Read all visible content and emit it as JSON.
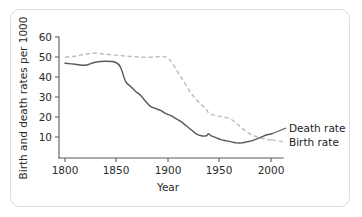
{
  "chart_data": {
    "type": "line",
    "title": "",
    "xlabel": "Year",
    "ylabel": "Birth and death rates per 1000",
    "xlim": [
      1800,
      2010
    ],
    "ylim": [
      0,
      60
    ],
    "xticks": [
      1800,
      1850,
      1900,
      1950,
      2000
    ],
    "yticks": [
      10,
      20,
      30,
      40,
      50,
      60
    ],
    "grid": false,
    "legend_position": "right-inline",
    "x": [
      1800,
      1810,
      1820,
      1830,
      1840,
      1850,
      1855,
      1860,
      1865,
      1870,
      1875,
      1880,
      1885,
      1890,
      1895,
      1900,
      1905,
      1910,
      1915,
      1920,
      1925,
      1930,
      1935,
      1940,
      1942,
      1945,
      1950,
      1955,
      1960,
      1965,
      1970,
      1975,
      1980,
      1985,
      1990,
      1995,
      2000,
      2005
    ],
    "series": [
      {
        "name": "Death rate",
        "style": "solid",
        "color": "#595959",
        "label": "Death rate",
        "values": [
          47,
          46.5,
          46,
          47.5,
          48,
          47.5,
          45,
          38,
          35.5,
          33,
          31,
          28,
          25.5,
          24.5,
          23.5,
          22,
          21,
          19.5,
          18,
          16,
          14,
          12,
          11,
          11,
          12,
          11,
          10,
          9,
          8.5,
          8,
          7.5,
          7.5,
          8,
          8.5,
          9.5,
          10.5,
          11.5,
          12
        ]
      },
      {
        "name": "Birth rate",
        "style": "dashed",
        "color": "#bdbdbd",
        "label": "Birth rate",
        "values": [
          50,
          50.5,
          51.5,
          52,
          51.5,
          51,
          50.8,
          50.5,
          50.3,
          50.2,
          50,
          50,
          50,
          50.2,
          50.3,
          50,
          48,
          44,
          40,
          36,
          32,
          29,
          26.5,
          24,
          22.5,
          21.5,
          21,
          20.5,
          20,
          19,
          17,
          15,
          13,
          11.5,
          10.5,
          9.8,
          9.2,
          9
        ]
      }
    ]
  },
  "legend": {
    "death_rate": "Death rate",
    "birth_rate": "Birth rate"
  },
  "axes": {
    "x_title": "Year",
    "y_title": "Birth and death rates per 1000",
    "x_tick_labels": [
      "1800",
      "1850",
      "1900",
      "1950",
      "2000"
    ],
    "y_tick_labels": [
      "10",
      "20",
      "30",
      "40",
      "50",
      "60"
    ]
  },
  "colors": {
    "solid_series": "#595959",
    "dashed_series": "#bdbdbd",
    "axis": "#5b5b5b",
    "card_border": "#dcdcdc",
    "background": "#ffffff"
  }
}
